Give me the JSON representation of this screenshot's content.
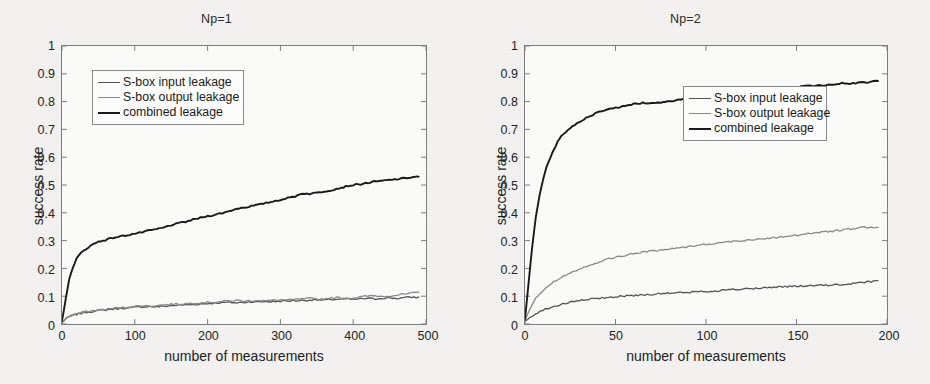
{
  "figure": {
    "background_color": "#f3f2f0",
    "axis_color": "#7d7d7d",
    "text_color": "#1d1d1d"
  },
  "series_colors": {
    "sbox_input": "#555555",
    "sbox_output": "#8a8a8a",
    "combined": "#1a1a1a"
  },
  "panels": [
    {
      "id": "left",
      "title": "Np=1",
      "xlabel": "number of measurements",
      "ylabel": "success rate",
      "xticks": [
        "0",
        "100",
        "200",
        "300",
        "400",
        "500"
      ],
      "yticks": [
        "0",
        "0.1",
        "0.2",
        "0.3",
        "0.4",
        "0.5",
        "0.6",
        "0.7",
        "0.8",
        "0.9",
        "1"
      ],
      "legend": {
        "items": [
          {
            "label": "S-box input leakage",
            "color": "#555555"
          },
          {
            "label": "S-box output leakage",
            "color": "#8a8a8a"
          },
          {
            "label": "combined leakage",
            "color": "#1a1a1a"
          }
        ]
      }
    },
    {
      "id": "right",
      "title": "Np=2",
      "xlabel": "number of measurements",
      "ylabel": "success rate",
      "xticks": [
        "0",
        "50",
        "100",
        "150",
        "200"
      ],
      "yticks": [
        "0",
        "0.1",
        "0.2",
        "0.3",
        "0.4",
        "0.5",
        "0.6",
        "0.7",
        "0.8",
        "0.9",
        "1"
      ],
      "legend": {
        "items": [
          {
            "label": "S-box input leakage",
            "color": "#555555"
          },
          {
            "label": "S-box output leakage",
            "color": "#8a8a8a"
          },
          {
            "label": "combined leakage",
            "color": "#1a1a1a"
          }
        ]
      }
    }
  ],
  "chart_data": [
    {
      "type": "line",
      "title": "Np=1",
      "xlabel": "number of measurements",
      "ylabel": "success rate",
      "xlim": [
        0,
        500
      ],
      "ylim": [
        0,
        1
      ],
      "xticks": [
        0,
        100,
        200,
        300,
        400,
        500
      ],
      "yticks": [
        0,
        0.1,
        0.2,
        0.3,
        0.4,
        0.5,
        0.6,
        0.7,
        0.8,
        0.9,
        1
      ],
      "grid": false,
      "legend_position": "upper-left-inside",
      "x": [
        0,
        5,
        10,
        15,
        20,
        25,
        30,
        40,
        50,
        60,
        70,
        80,
        90,
        100,
        110,
        120,
        130,
        140,
        150,
        160,
        170,
        180,
        190,
        200,
        210,
        220,
        230,
        240,
        250,
        260,
        270,
        280,
        290,
        300,
        310,
        320,
        330,
        340,
        350,
        360,
        370,
        380,
        390,
        400,
        410,
        420,
        430,
        440,
        450,
        460,
        470,
        480,
        490
      ],
      "series": [
        {
          "name": "S-box input leakage",
          "color": "#555555",
          "values": [
            0.005,
            0.018,
            0.026,
            0.031,
            0.035,
            0.038,
            0.041,
            0.045,
            0.048,
            0.051,
            0.054,
            0.056,
            0.058,
            0.06,
            0.062,
            0.063,
            0.062,
            0.064,
            0.066,
            0.068,
            0.069,
            0.07,
            0.072,
            0.074,
            0.075,
            0.077,
            0.078,
            0.076,
            0.078,
            0.08,
            0.079,
            0.081,
            0.08,
            0.082,
            0.083,
            0.084,
            0.085,
            0.086,
            0.087,
            0.085,
            0.088,
            0.089,
            0.09,
            0.088,
            0.091,
            0.092,
            0.09,
            0.093,
            0.094,
            0.092,
            0.095,
            0.096,
            0.097
          ]
        },
        {
          "name": "S-box output leakage",
          "color": "#8a8a8a",
          "values": [
            0.005,
            0.02,
            0.028,
            0.033,
            0.037,
            0.04,
            0.043,
            0.047,
            0.05,
            0.053,
            0.056,
            0.058,
            0.06,
            0.063,
            0.066,
            0.064,
            0.067,
            0.069,
            0.071,
            0.072,
            0.073,
            0.075,
            0.077,
            0.078,
            0.079,
            0.081,
            0.083,
            0.085,
            0.082,
            0.084,
            0.086,
            0.083,
            0.085,
            0.087,
            0.086,
            0.088,
            0.09,
            0.092,
            0.089,
            0.091,
            0.093,
            0.095,
            0.092,
            0.094,
            0.098,
            0.1,
            0.102,
            0.099,
            0.101,
            0.104,
            0.107,
            0.11,
            0.115
          ]
        },
        {
          "name": "combined leakage",
          "color": "#1a1a1a",
          "values": [
            0.01,
            0.09,
            0.16,
            0.205,
            0.235,
            0.252,
            0.265,
            0.283,
            0.296,
            0.303,
            0.31,
            0.315,
            0.32,
            0.325,
            0.33,
            0.336,
            0.341,
            0.347,
            0.356,
            0.362,
            0.368,
            0.375,
            0.382,
            0.388,
            0.393,
            0.399,
            0.406,
            0.415,
            0.419,
            0.424,
            0.429,
            0.435,
            0.441,
            0.447,
            0.453,
            0.459,
            0.47,
            0.468,
            0.472,
            0.477,
            0.482,
            0.488,
            0.495,
            0.5,
            0.503,
            0.508,
            0.512,
            0.515,
            0.518,
            0.521,
            0.524,
            0.528,
            0.53
          ]
        }
      ]
    },
    {
      "type": "line",
      "title": "Np=2",
      "xlabel": "number of measurements",
      "ylabel": "success rate",
      "xlim": [
        0,
        200
      ],
      "ylim": [
        0,
        1
      ],
      "xticks": [
        0,
        50,
        100,
        150,
        200
      ],
      "yticks": [
        0,
        0.1,
        0.2,
        0.3,
        0.4,
        0.5,
        0.6,
        0.7,
        0.8,
        0.9,
        1
      ],
      "grid": false,
      "legend_position": "center-right-inside",
      "x": [
        0,
        2,
        4,
        6,
        8,
        10,
        12,
        15,
        18,
        20,
        25,
        30,
        35,
        40,
        45,
        50,
        55,
        60,
        65,
        70,
        75,
        80,
        85,
        90,
        95,
        100,
        105,
        110,
        115,
        120,
        125,
        130,
        135,
        140,
        145,
        150,
        155,
        160,
        165,
        170,
        175,
        180,
        185,
        190,
        195
      ],
      "series": [
        {
          "name": "S-box input leakage",
          "color": "#555555",
          "values": [
            0.008,
            0.02,
            0.03,
            0.038,
            0.044,
            0.05,
            0.055,
            0.061,
            0.066,
            0.07,
            0.078,
            0.084,
            0.088,
            0.092,
            0.095,
            0.098,
            0.101,
            0.103,
            0.105,
            0.107,
            0.109,
            0.111,
            0.112,
            0.114,
            0.116,
            0.117,
            0.119,
            0.122,
            0.124,
            0.125,
            0.127,
            0.129,
            0.131,
            0.134,
            0.135,
            0.136,
            0.137,
            0.138,
            0.139,
            0.14,
            0.142,
            0.145,
            0.148,
            0.152,
            0.156
          ]
        },
        {
          "name": "S-box output leakage",
          "color": "#8a8a8a",
          "values": [
            0.01,
            0.045,
            0.072,
            0.092,
            0.108,
            0.122,
            0.133,
            0.148,
            0.16,
            0.168,
            0.185,
            0.198,
            0.21,
            0.222,
            0.232,
            0.24,
            0.247,
            0.253,
            0.258,
            0.263,
            0.266,
            0.27,
            0.274,
            0.279,
            0.283,
            0.287,
            0.29,
            0.294,
            0.297,
            0.3,
            0.303,
            0.306,
            0.309,
            0.312,
            0.316,
            0.32,
            0.324,
            0.328,
            0.331,
            0.334,
            0.338,
            0.342,
            0.346,
            0.349,
            0.348
          ]
        },
        {
          "name": "combined leakage",
          "color": "#1a1a1a",
          "values": [
            0.02,
            0.15,
            0.28,
            0.385,
            0.46,
            0.52,
            0.565,
            0.615,
            0.655,
            0.675,
            0.705,
            0.728,
            0.746,
            0.76,
            0.77,
            0.778,
            0.784,
            0.791,
            0.796,
            0.795,
            0.798,
            0.801,
            0.806,
            0.811,
            0.815,
            0.819,
            0.823,
            0.827,
            0.83,
            0.833,
            0.837,
            0.84,
            0.843,
            0.846,
            0.849,
            0.852,
            0.855,
            0.857,
            0.859,
            0.862,
            0.866,
            0.865,
            0.868,
            0.87,
            0.874
          ]
        }
      ]
    }
  ]
}
